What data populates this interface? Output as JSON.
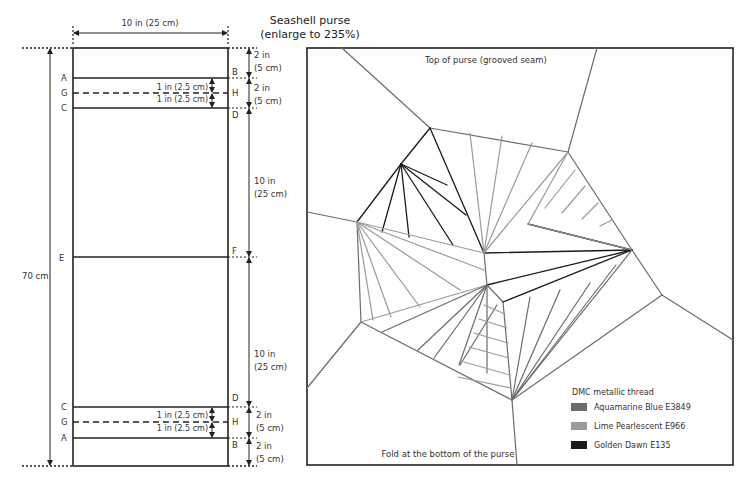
{
  "title": {
    "line1": "Seashell purse",
    "line2": "(enlarge to 235%)"
  },
  "layout_diagram": {
    "width_label": "10 in (25 cm)",
    "total_height_label": "70 cm",
    "left_labels": [
      "A",
      "G",
      "C",
      "E",
      "C",
      "G",
      "A"
    ],
    "right_labels": [
      "B",
      "H",
      "D",
      "F",
      "D",
      "H",
      "B"
    ],
    "top_dims": [
      {
        "line1": "2 in",
        "line2": "(5 cm)"
      },
      {
        "line1": "2 in",
        "line2": "(5 cm)"
      }
    ],
    "mid_dims": [
      {
        "line1": "10 in",
        "line2": "(25 cm)"
      },
      {
        "line1": "10 in",
        "line2": "(25 cm)"
      }
    ],
    "bottom_dims": [
      {
        "line1": "2 in",
        "line2": "(5 cm)"
      },
      {
        "line1": "2 in",
        "line2": "(5 cm)"
      }
    ],
    "inner_dims": {
      "top_upper": "1 in (2.5 cm)",
      "top_lower": "1 in (2.5 cm)",
      "bottom_upper": "1 in (2.5 cm)",
      "bottom_lower": "1 in (2.5 cm)"
    }
  },
  "shell_pattern": {
    "top_label": "Top of purse (grooved seam)",
    "bottom_label": "Fold at the bottom of the purse",
    "legend": {
      "title": "DMC metallic thread",
      "items": [
        {
          "label": "Aquamarine Blue E3849",
          "color": "#6b6b6b"
        },
        {
          "label": "Lime Pearlescent E966",
          "color": "#9a9a9a"
        },
        {
          "label": "Golden Dawn E135",
          "color": "#1a1a1a"
        }
      ]
    },
    "colors": {
      "aquamarine": "#6b6b6b",
      "lime": "#9a9a9a",
      "golden": "#1a1a1a"
    }
  }
}
